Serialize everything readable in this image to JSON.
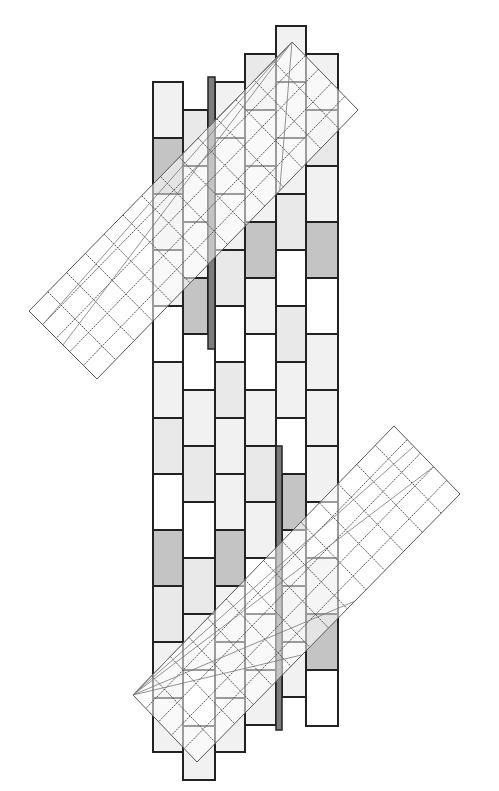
{
  "diagram": {
    "title": "",
    "colors": {
      "white": "#ffffff",
      "light": "#f1f1f1",
      "lighter": "#e9e9e9",
      "medium": "#d8d8d8",
      "dark": "#c4c4c4",
      "bar": "#7d7d7d",
      "outline": "#222222",
      "mesh": "#555555"
    },
    "columns": [
      {
        "name": "column-1",
        "shades": [
          "light",
          "dark",
          "lighter",
          "light",
          "white",
          "light",
          "lighter",
          "white",
          "dark",
          "lighter",
          "light",
          "light"
        ]
      },
      {
        "name": "column-2",
        "shades": [
          "lighter",
          "light",
          "light",
          "dark",
          "white",
          "light",
          "lighter",
          "white",
          "lighter",
          "light",
          "white",
          "light",
          "light"
        ]
      },
      {
        "name": "column-3",
        "shades": [
          "light",
          "light",
          "light",
          "lighter",
          "white",
          "lighter",
          "light",
          "light",
          "dark",
          "light",
          "light",
          "light"
        ]
      },
      {
        "name": "column-4",
        "shades": [
          "lighter",
          "light",
          "light",
          "dark",
          "light",
          "white",
          "light",
          "lighter",
          "light",
          "white",
          "light",
          "light"
        ]
      },
      {
        "name": "column-5",
        "shades": [
          "light",
          "light",
          "light",
          "lighter",
          "white",
          "lighter",
          "light",
          "white",
          "dark",
          "light",
          "lighter",
          "light"
        ]
      },
      {
        "name": "column-6",
        "shades": [
          "light",
          "lighter",
          "light",
          "dark",
          "white",
          "light",
          "light",
          "light",
          "white",
          "lighter",
          "dark",
          "white"
        ]
      }
    ],
    "bars": [
      {
        "name": "dark-bar-upper"
      },
      {
        "name": "dark-bar-lower"
      }
    ],
    "meshes": [
      {
        "name": "mesh-upper",
        "grid_cells": [
          5,
          14
        ]
      },
      {
        "name": "mesh-lower",
        "grid_cells": [
          5,
          14
        ]
      }
    ]
  }
}
